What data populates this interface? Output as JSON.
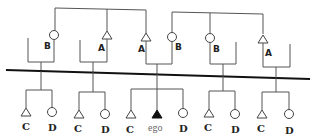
{
  "diagram": {
    "type": "kinship-chart",
    "upper_generation": {
      "groups": [
        {
          "person": {
            "symbol": "circle",
            "label": "B"
          }
        },
        {
          "person": {
            "symbol": "triangle",
            "label": "A"
          }
        },
        {
          "persons": [
            {
              "symbol": "triangle",
              "label": "A"
            },
            {
              "symbol": "circle",
              "label": "B"
            }
          ]
        },
        {
          "person": {
            "symbol": "circle",
            "label": "B"
          }
        },
        {
          "person": {
            "symbol": "triangle",
            "label": "A"
          }
        }
      ]
    },
    "lower_generation": {
      "groups": [
        {
          "children": [
            {
              "symbol": "triangle",
              "label": "C"
            },
            {
              "symbol": "circle",
              "label": "D"
            }
          ]
        },
        {
          "children": [
            {
              "symbol": "triangle",
              "label": "C"
            },
            {
              "symbol": "circle",
              "label": "D"
            }
          ]
        },
        {
          "children": [
            {
              "symbol": "triangle",
              "label": "C"
            },
            {
              "symbol": "filled-triangle",
              "label": "ego"
            },
            {
              "symbol": "circle",
              "label": "D"
            }
          ]
        },
        {
          "children": [
            {
              "symbol": "triangle",
              "label": "C"
            },
            {
              "symbol": "circle",
              "label": "D"
            }
          ]
        },
        {
          "children": [
            {
              "symbol": "triangle",
              "label": "C"
            },
            {
              "symbol": "circle",
              "label": "D"
            }
          ]
        }
      ]
    },
    "labels": {
      "g1_top": "B",
      "g2_top": "A",
      "g3_top_left": "A",
      "g3_top_right": "B",
      "g4_top": "B",
      "g5_top": "A",
      "g1_c": "C",
      "g1_d": "D",
      "g2_c": "C",
      "g2_d": "D",
      "g3_c": "C",
      "g3_ego": "ego",
      "g3_d": "D",
      "g4_c": "C",
      "g4_d": "D",
      "g5_c": "C",
      "g5_d": "D"
    },
    "colors": {
      "line": "#555555",
      "generation_divider": "#111111",
      "ego_fill": "#111111"
    }
  }
}
